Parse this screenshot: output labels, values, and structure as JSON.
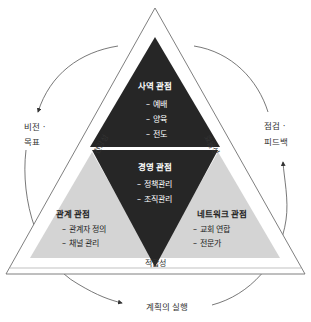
{
  "colors": {
    "dark": "#262626",
    "light": "#d4d4d4",
    "outline": "#707070",
    "text_light": "#ffffff",
    "text_dark": "#222222",
    "line": "#555555"
  },
  "sections": {
    "top": {
      "title": "사역 관점",
      "items": [
        "– 예배",
        "– 양육",
        "– 전도"
      ]
    },
    "middle": {
      "title": "경영 관점",
      "items": [
        "– 정책관리",
        "– 조직관리"
      ]
    },
    "left": {
      "title": "관계 관점",
      "items": [
        "– 관계자 정의",
        "– 채널 관리"
      ]
    },
    "right": {
      "title": "네트워크 관점",
      "items": [
        "– 교회 연합",
        "– 전문가"
      ]
    }
  },
  "edges": {
    "left": "건강성",
    "right": "효율성",
    "bottom": "적합성"
  },
  "cycle": {
    "left_line1": "비전 ·",
    "left_line2": "목표",
    "right_line1": "점검 ·",
    "right_line2": "피드백",
    "bottom": "계획의 실행"
  }
}
